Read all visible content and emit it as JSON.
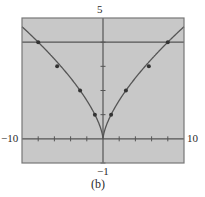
{
  "chart_data": {
    "type": "line",
    "title": "",
    "caption": "(b)",
    "xlabel": "",
    "ylabel": "",
    "xlim": [
      -10,
      10
    ],
    "ylim": [
      -1,
      5
    ],
    "window_labels": {
      "xmin": "−10",
      "xmax": "10",
      "ymin": "−1",
      "ymax": "5"
    },
    "x_tick_step": 2,
    "y_tick_step": 1,
    "grid": false,
    "background_color": "#c8c8c8",
    "line_color": "#555555",
    "series": [
      {
        "name": "y = x^(2/3)",
        "kind": "curve",
        "function": "abs(x)^(2/3)",
        "markers": [
          {
            "x": -8,
            "y": 4
          },
          {
            "x": -5.66,
            "y": 3
          },
          {
            "x": -2.83,
            "y": 2
          },
          {
            "x": -1,
            "y": 1
          },
          {
            "x": 1,
            "y": 1
          },
          {
            "x": 2.83,
            "y": 2
          },
          {
            "x": 5.66,
            "y": 3
          },
          {
            "x": 8,
            "y": 4
          }
        ]
      },
      {
        "name": "y = 4",
        "kind": "horizontal-line",
        "y": 4
      }
    ]
  }
}
